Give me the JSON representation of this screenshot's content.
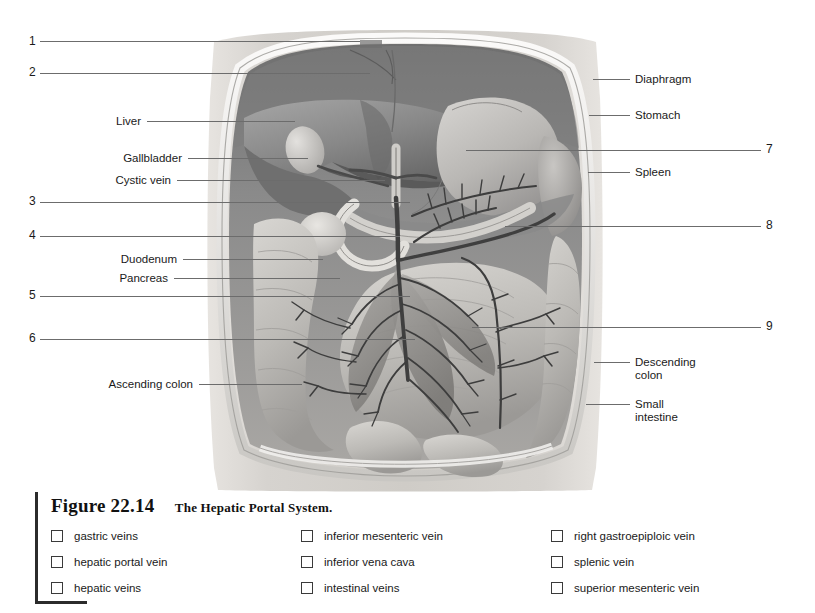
{
  "figure": {
    "number": "Figure 22.14",
    "title": "The Hepatic Portal System."
  },
  "numbered_callouts": [
    {
      "num": "1",
      "side": "left",
      "x": 29,
      "y": 35,
      "line_x": 40,
      "line_y": 41,
      "line_w": 320
    },
    {
      "num": "2",
      "side": "left",
      "x": 29,
      "y": 66,
      "line_x": 40,
      "line_y": 73,
      "line_w": 330
    },
    {
      "num": "3",
      "side": "left",
      "x": 29,
      "y": 195,
      "line_x": 40,
      "line_y": 202,
      "line_w": 370
    },
    {
      "num": "4",
      "side": "left",
      "x": 29,
      "y": 229,
      "line_x": 40,
      "line_y": 236,
      "line_w": 360
    },
    {
      "num": "5",
      "side": "left",
      "x": 29,
      "y": 289,
      "line_x": 40,
      "line_y": 296,
      "line_w": 370
    },
    {
      "num": "6",
      "side": "left",
      "x": 29,
      "y": 332,
      "line_x": 40,
      "line_y": 339,
      "line_w": 375
    },
    {
      "num": "7",
      "side": "right",
      "x": 766,
      "y": 143,
      "line_x": 466,
      "line_y": 150,
      "line_w": 295
    },
    {
      "num": "8",
      "side": "right",
      "x": 766,
      "y": 219,
      "line_x": 505,
      "line_y": 226,
      "line_w": 256
    },
    {
      "num": "9",
      "side": "right",
      "x": 766,
      "y": 320,
      "line_x": 472,
      "line_y": 327,
      "line_w": 289
    }
  ],
  "named_callouts": [
    {
      "label": "Liver",
      "side": "left",
      "x": 56,
      "y": 115,
      "line_x": 147,
      "line_y": 121,
      "line_w": 148
    },
    {
      "label": "Gallbladder",
      "side": "left",
      "x": 56,
      "y": 152,
      "line_x": 188,
      "line_y": 158,
      "line_w": 120
    },
    {
      "label": "Cystic vein",
      "side": "left",
      "x": 56,
      "y": 174,
      "line_x": 177,
      "line_y": 180,
      "line_w": 208
    },
    {
      "label": "Duodenum",
      "side": "left",
      "x": 56,
      "y": 253,
      "line_x": 183,
      "line_y": 259,
      "line_w": 140
    },
    {
      "label": "Pancreas",
      "side": "left",
      "x": 56,
      "y": 272,
      "line_x": 174,
      "line_y": 278,
      "line_w": 166
    },
    {
      "label": "Ascending colon",
      "side": "left",
      "x": 56,
      "y": 378,
      "line_x": 199,
      "line_y": 384,
      "line_w": 103
    },
    {
      "label": "Diaphragm",
      "side": "right",
      "x": 635,
      "y": 73,
      "line_x": 593,
      "line_y": 79,
      "line_w": 37
    },
    {
      "label": "Stomach",
      "side": "right",
      "x": 635,
      "y": 109,
      "line_x": 589,
      "line_y": 115,
      "line_w": 41
    },
    {
      "label": "Spleen",
      "side": "right",
      "x": 635,
      "y": 166,
      "line_x": 588,
      "line_y": 172,
      "line_w": 42
    },
    {
      "label": "Descending\ncolon",
      "side": "right",
      "x": 635,
      "y": 356,
      "line_x": 594,
      "line_y": 362,
      "line_w": 36
    },
    {
      "label": "Small\nintestine",
      "side": "right",
      "x": 635,
      "y": 398,
      "line_x": 586,
      "line_y": 404,
      "line_w": 44
    }
  ],
  "term_columns": [
    {
      "terms": [
        {
          "label": "gastric veins",
          "checked": false
        },
        {
          "label": "hepatic portal vein",
          "checked": false
        },
        {
          "label": "hepatic veins",
          "checked": false
        }
      ]
    },
    {
      "terms": [
        {
          "label": "inferior mesenteric vein",
          "checked": false
        },
        {
          "label": "inferior vena cava",
          "checked": false
        },
        {
          "label": "intestinal veins",
          "checked": false
        }
      ]
    },
    {
      "terms": [
        {
          "label": "right gastroepiploic vein",
          "checked": false
        },
        {
          "label": "splenic vein",
          "checked": false
        },
        {
          "label": "superior mesenteric vein",
          "checked": false
        }
      ]
    }
  ],
  "artwork": {
    "description": "Grayscale anterior-view illustration of the opened abdominal cavity showing the hepatic portal system",
    "palette": {
      "body_wall": "#d9d6d2",
      "cavity_shadow": "#8d8d8d",
      "liver": "#8f8f8f",
      "liver_dark": "#6b6b6b",
      "stomach": "#b4b4b4",
      "intestine": "#c4c2bf",
      "vein_dark": "#3d3d3d",
      "vein_mid": "#7a7a7a",
      "mesentery": "#9a9a9a",
      "outline": "#4a4a4a",
      "highlight": "#efeeec"
    }
  }
}
